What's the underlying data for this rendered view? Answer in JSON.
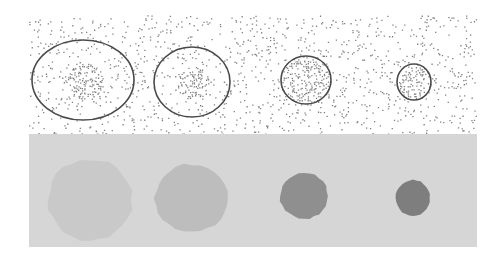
{
  "figure": {
    "width": 503,
    "height": 262,
    "background": "#ffffff",
    "top_panel": {
      "x": 29,
      "y": 15,
      "width": 448,
      "height": 119,
      "background": "#ffffff",
      "noise_color": "#6a6a6a",
      "noise_density": 0.085,
      "contour_color": "#4a4a4a",
      "contour_width": 1.6,
      "objects": [
        {
          "cx": 83,
          "cy": 80,
          "rx": 51,
          "ry": 40,
          "core_r": 19,
          "core_density": 0.45
        },
        {
          "cx": 192,
          "cy": 82,
          "rx": 38,
          "ry": 35,
          "core_r": 17,
          "core_density": 0.45
        },
        {
          "cx": 306,
          "cy": 80,
          "rx": 25,
          "ry": 24,
          "core_r": 24,
          "core_density": 0.42
        },
        {
          "cx": 414,
          "cy": 82,
          "rx": 17,
          "ry": 18,
          "core_r": 17,
          "core_density": 0.42
        }
      ]
    },
    "bottom_panel": {
      "x": 29,
      "y": 134,
      "width": 448,
      "height": 113,
      "background": "#d6d6d6",
      "blobs": [
        {
          "cx": 90,
          "cy": 200,
          "rx": 42,
          "ry": 41,
          "color": "#c9c9c9"
        },
        {
          "cx": 192,
          "cy": 198,
          "rx": 37,
          "ry": 34,
          "color": "#bdbdbd"
        },
        {
          "cx": 304,
          "cy": 196,
          "rx": 24,
          "ry": 23,
          "color": "#8f8f8f"
        },
        {
          "cx": 413,
          "cy": 198,
          "rx": 17,
          "ry": 18,
          "color": "#7e7e7e"
        }
      ]
    }
  }
}
